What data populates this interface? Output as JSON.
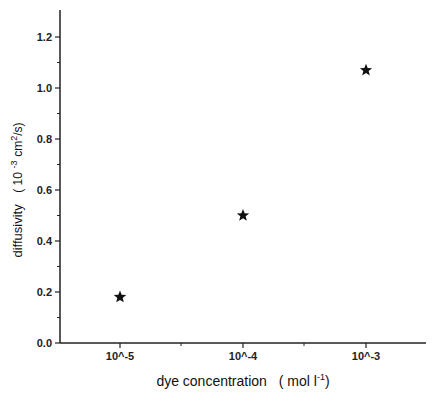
{
  "chart_data": {
    "type": "scatter",
    "title": "",
    "xlabel": "dye concentration (mol l-1)",
    "xlabel_parts": {
      "main": "dye concentration",
      "unit_open": "( mol l",
      "unit_sup": "-1",
      "unit_close": ")"
    },
    "ylabel": "diffusivity (10 -3 cm2/s)",
    "ylabel_parts": {
      "main": "diffusivity",
      "unit_open": "( 10",
      "unit_sup1": "-3",
      "unit_mid": "cm",
      "unit_sup2": "2",
      "unit_close": "/s)"
    },
    "categories": [
      "10^-5",
      "10^-4",
      "10^-3"
    ],
    "x_tick_labels": [
      "10^-5",
      "10^-4",
      "10^-3"
    ],
    "y_ticks": [
      0.0,
      0.2,
      0.4,
      0.6,
      0.8,
      1.0,
      1.2
    ],
    "y_tick_labels": [
      "0.0",
      "0.2",
      "0.4",
      "0.6",
      "0.8",
      "1.0",
      "1.2"
    ],
    "ylim": [
      0.0,
      1.3
    ],
    "grid": false,
    "legend": null,
    "marker": "star",
    "series": [
      {
        "name": "diffusivity",
        "values": [
          0.18,
          0.5,
          1.07
        ]
      }
    ],
    "points": [
      {
        "x": "10^-5",
        "y": 0.18
      },
      {
        "x": "10^-4",
        "y": 0.5
      },
      {
        "x": "10^-3",
        "y": 1.07
      }
    ]
  },
  "colors": {
    "axis": "#222222",
    "marker": "#111111",
    "background": "#ffffff"
  }
}
